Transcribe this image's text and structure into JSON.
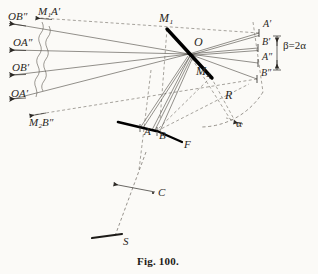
{
  "figure": {
    "caption": "Fig. 100.",
    "background_color": "#fbfaf7",
    "ink_color": "#2a2723",
    "mirror_color": "#000000"
  },
  "labels": {
    "ob_double_prime": "OB″",
    "m1_a_prime": "M₁A′",
    "oa_double_prime": "OA″",
    "ob_prime": "OB′",
    "oa_prime": "OA′",
    "m2_b_double_prime": "M₂B″",
    "m1": "M₁",
    "o": "O",
    "m2": "M₂",
    "a_prime": "A′",
    "b_prime": "B′",
    "a_double_prime": "A″",
    "b_double_prime": "B″",
    "beta_equals_two_alpha": "β=2α",
    "r": "R",
    "alpha": "α",
    "a": "A",
    "b": "B",
    "f": "F",
    "c": "C",
    "s": "S"
  },
  "label_positions": {
    "ob_double_prime": {
      "x": 8,
      "y": 16
    },
    "m1_a_prime": {
      "x": 38,
      "y": 11
    },
    "oa_double_prime": {
      "x": 13,
      "y": 43
    },
    "ob_prime": {
      "x": 12,
      "y": 68
    },
    "oa_prime": {
      "x": 11,
      "y": 94
    },
    "m2_b_double_prime": {
      "x": 29,
      "y": 122
    },
    "m1": {
      "x": 161,
      "y": 20
    },
    "o": {
      "x": 196,
      "y": 43
    },
    "m2": {
      "x": 198,
      "y": 72
    },
    "a_prime": {
      "x": 264,
      "y": 25
    },
    "b_prime": {
      "x": 263,
      "y": 44
    },
    "a_double_prime": {
      "x": 263,
      "y": 58
    },
    "b_double_prime": {
      "x": 262,
      "y": 74
    },
    "beta_equals_two_alpha": {
      "x": 283,
      "y": 45
    },
    "r": {
      "x": 227,
      "y": 96
    },
    "alpha": {
      "x": 236,
      "y": 124
    },
    "a": {
      "x": 146,
      "y": 133
    },
    "b": {
      "x": 160,
      "y": 136
    },
    "f": {
      "x": 185,
      "y": 146
    },
    "c": {
      "x": 159,
      "y": 195
    },
    "s": {
      "x": 124,
      "y": 243
    }
  },
  "geometry": {
    "center_o": {
      "x": 189,
      "y": 54
    },
    "mirror_m1": {
      "x": 167,
      "y": 29
    },
    "mirror_m2": {
      "x": 211,
      "y": 77
    },
    "scale_a": {
      "x": 139,
      "y": 128
    },
    "scale_b": {
      "x": 157,
      "y": 131
    },
    "scale_f": {
      "x": 183,
      "y": 142
    },
    "right_targets": [
      {
        "name": "A′",
        "x": 259,
        "y": 33
      },
      {
        "name": "B′",
        "x": 258,
        "y": 48
      },
      {
        "name": "B″",
        "x": 257,
        "y": 79
      },
      {
        "name": "A″",
        "x": 258,
        "y": 63
      }
    ],
    "left_arrow_tips": [
      {
        "name": "OB″",
        "x": 10,
        "y": 24
      },
      {
        "name": "OA″",
        "x": 9,
        "y": 50
      },
      {
        "name": "OB′",
        "x": 9,
        "y": 75
      },
      {
        "name": "OA′",
        "x": 9,
        "y": 99
      },
      {
        "name": "M₂B″",
        "x": 29,
        "y": 116
      },
      {
        "name": "M₁A′",
        "x": 36,
        "y": 19
      }
    ],
    "break_lines_x": [
      42,
      47
    ],
    "crosshair_c": {
      "x": 140,
      "y": 190
    },
    "base_s": {
      "x": 110,
      "y": 238
    },
    "arc_radius_from_o": 74,
    "alpha_angle_deg": 22
  },
  "annotations": {
    "brace_beta_top": {
      "x": 276,
      "y": 34
    },
    "brace_beta_bottom": {
      "x": 276,
      "y": 70
    }
  }
}
